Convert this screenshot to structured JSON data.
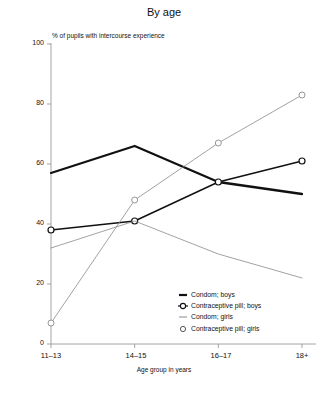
{
  "chart_data": {
    "type": "line",
    "title": "By age",
    "xlabel": "Age group in years",
    "ylabel": "% of pupils with intercourse experience",
    "categories": [
      "11–13",
      "14–15",
      "16–17",
      "18+"
    ],
    "ylim": [
      0,
      100
    ],
    "yticks": [
      0,
      20,
      40,
      60,
      80,
      100
    ],
    "grid": false,
    "legend_position": "inside-bottom-right",
    "series": [
      {
        "name": "Condom; boys",
        "values": [
          57,
          66,
          54,
          50
        ],
        "color": "#111111",
        "width": 2.3,
        "marker": "none"
      },
      {
        "name": "Contraceptive pill; boys",
        "values": [
          38,
          41,
          54,
          61
        ],
        "color": "#111111",
        "width": 1.5,
        "marker": "circle"
      },
      {
        "name": "Condom; girls",
        "values": [
          32,
          41,
          30,
          22
        ],
        "color": "#8a8a8a",
        "width": 0.8,
        "marker": "none"
      },
      {
        "name": "Contraceptive pill; girls",
        "values": [
          7,
          48,
          67,
          83
        ],
        "color": "#8a8a8a",
        "width": 0.8,
        "marker": "circle"
      }
    ]
  },
  "axis": {
    "y_tick_labels": [
      "0",
      "20",
      "40",
      "60",
      "80",
      "100"
    ],
    "x_tick_labels": [
      "11–13",
      "14–15",
      "16–17",
      "18+"
    ]
  },
  "legend": {
    "items": [
      {
        "label": "Condom; boys",
        "mark": "thick-dash-icon"
      },
      {
        "label": "Contraceptive pill; boys",
        "mark": "circle-dash-icon"
      },
      {
        "label": "Condom; girls",
        "mark": "thin-dash-icon"
      },
      {
        "label": "Contraceptive pill; girls",
        "mark": "circle-icon"
      }
    ]
  }
}
